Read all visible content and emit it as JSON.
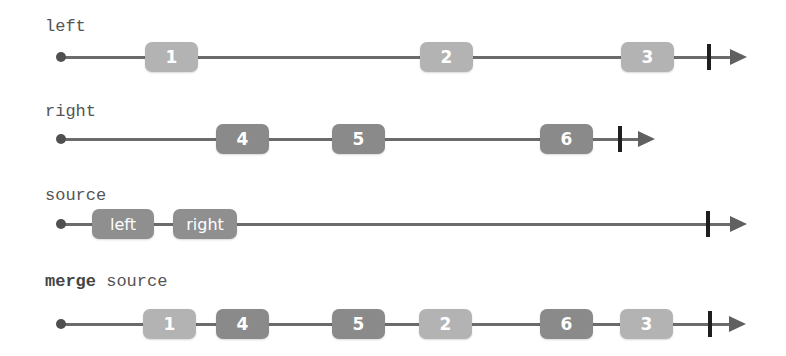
{
  "colors": {
    "line": "#6b6b6b",
    "start_dot": "#505050",
    "terminator": "#1e1e1e",
    "arrow": "#606060",
    "marble_left": "#b3b3b3",
    "marble_right": "#8a8a8a",
    "marble_source": "#8f8f8f"
  },
  "rows": [
    {
      "label": "left",
      "marbles": [
        {
          "value": "1"
        },
        {
          "value": "2"
        },
        {
          "value": "3"
        }
      ]
    },
    {
      "label": "right",
      "marbles": [
        {
          "value": "4"
        },
        {
          "value": "5"
        },
        {
          "value": "6"
        }
      ]
    },
    {
      "label": "source",
      "marbles": [
        {
          "value": "left"
        },
        {
          "value": "right"
        }
      ]
    },
    {
      "label_keyword": "merge",
      "label_rest": " source",
      "marbles": [
        {
          "value": "1"
        },
        {
          "value": "4"
        },
        {
          "value": "5"
        },
        {
          "value": "2"
        },
        {
          "value": "6"
        },
        {
          "value": "3"
        }
      ]
    }
  ]
}
